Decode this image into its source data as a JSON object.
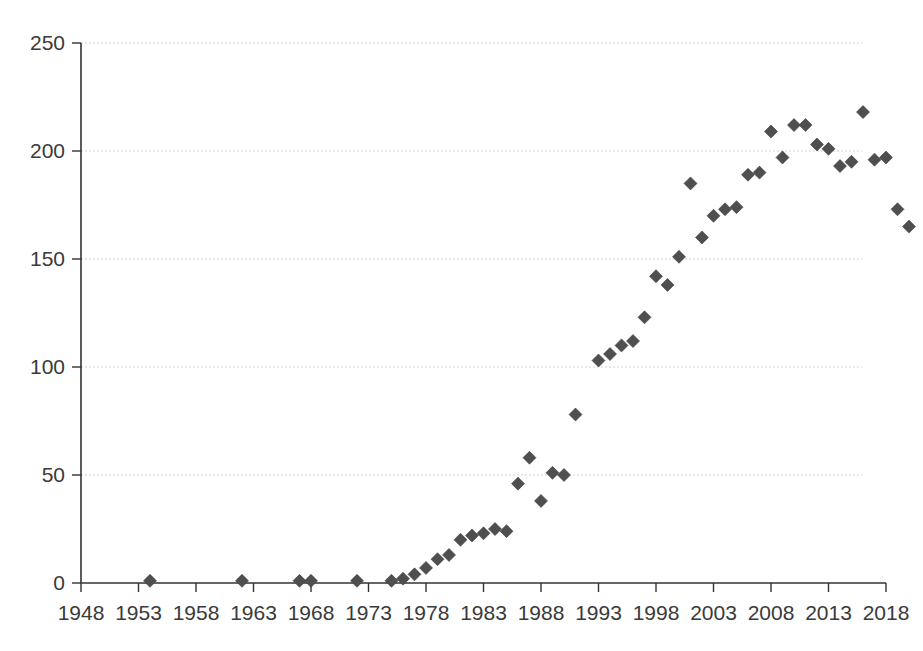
{
  "chart_data": {
    "type": "scatter",
    "title": "",
    "subtitle": "",
    "xlabel": "",
    "ylabel": "",
    "xlim": [
      1948,
      2018
    ],
    "ylim": [
      0,
      250
    ],
    "grid": true,
    "legend": false,
    "legend_position": "none",
    "marker": {
      "shape": "diamond",
      "color": "#4f4f4f",
      "size": 13
    },
    "axis_color": "#333333",
    "gridline_color": "#c9c9c9",
    "background_color": "#ffffff",
    "xticks": [
      1948,
      1953,
      1958,
      1963,
      1968,
      1973,
      1978,
      1983,
      1988,
      1993,
      1998,
      2003,
      2008,
      2013,
      2018
    ],
    "xtick_labels": [
      "1948",
      "1953",
      "1958",
      "1963",
      "1968",
      "1973",
      "1978",
      "1983",
      "1988",
      "1993",
      "1998",
      "2003",
      "2008",
      "2013",
      "2018"
    ],
    "yticks": [
      0,
      50,
      100,
      150,
      200,
      250
    ],
    "ytick_labels": [
      "0",
      "50",
      "100",
      "150",
      "200",
      "250"
    ],
    "series": [
      {
        "name": "series-1",
        "points": [
          [
            1954,
            1
          ],
          [
            1962,
            1
          ],
          [
            1967,
            1
          ],
          [
            1968,
            1
          ],
          [
            1972,
            1
          ],
          [
            1975,
            1
          ],
          [
            1976,
            2
          ],
          [
            1977,
            4
          ],
          [
            1978,
            7
          ],
          [
            1979,
            11
          ],
          [
            1980,
            13
          ],
          [
            1981,
            20
          ],
          [
            1982,
            22
          ],
          [
            1983,
            23
          ],
          [
            1984,
            25
          ],
          [
            1985,
            24
          ],
          [
            1986,
            46
          ],
          [
            1987,
            58
          ],
          [
            1988,
            38
          ],
          [
            1989,
            51
          ],
          [
            1990,
            50
          ],
          [
            1991,
            78
          ],
          [
            1993,
            103
          ],
          [
            1994,
            106
          ],
          [
            1995,
            110
          ],
          [
            1996,
            112
          ],
          [
            1997,
            123
          ],
          [
            1998,
            142
          ],
          [
            1999,
            138
          ],
          [
            2000,
            151
          ],
          [
            2001,
            185
          ],
          [
            2002,
            160
          ],
          [
            2003,
            170
          ],
          [
            2004,
            173
          ],
          [
            2005,
            174
          ],
          [
            2006,
            189
          ],
          [
            2007,
            190
          ],
          [
            2008,
            209
          ],
          [
            2009,
            197
          ],
          [
            2010,
            212
          ],
          [
            2011,
            212
          ],
          [
            2012,
            203
          ],
          [
            2013,
            201
          ],
          [
            2014,
            193
          ],
          [
            2015,
            195
          ],
          [
            2016,
            218
          ],
          [
            2017,
            196
          ],
          [
            2018,
            197
          ],
          [
            2019,
            173
          ],
          [
            2020,
            165
          ]
        ]
      }
    ]
  }
}
